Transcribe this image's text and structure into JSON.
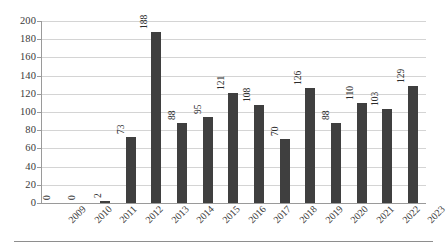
{
  "chart_data": {
    "type": "bar",
    "title": "",
    "subtitle": "",
    "xlabel": "",
    "ylabel": "",
    "categories": [
      "2009",
      "2010",
      "2011",
      "2012",
      "2013",
      "2014",
      "2015",
      "2016",
      "2017",
      "2018",
      "2019",
      "2020",
      "2021",
      "2022",
      "2023"
    ],
    "values": [
      0,
      0,
      2,
      73,
      188,
      88,
      95,
      121,
      108,
      70,
      126,
      88,
      110,
      103,
      129
    ],
    "data_labels": [
      "0",
      "0",
      "2",
      "73",
      "188",
      "88",
      "95",
      "121",
      "108",
      "70",
      "126",
      "88",
      "110",
      "103",
      "129"
    ],
    "ylim": [
      0,
      200
    ],
    "y_ticks": [
      0,
      20,
      40,
      60,
      80,
      100,
      120,
      140,
      160,
      180,
      200
    ],
    "y_tick_labels": [
      "0",
      "20",
      "40",
      "60",
      "80",
      "100",
      "120",
      "140",
      "160",
      "180",
      "200"
    ],
    "grid": true,
    "grid_axis": "y",
    "legend": false,
    "legend_position": "none",
    "series": [
      {
        "name": "",
        "values": [
          0,
          0,
          2,
          73,
          188,
          88,
          95,
          121,
          108,
          70,
          126,
          88,
          110,
          103,
          129
        ]
      }
    ]
  },
  "style": {
    "bar_color": "#3f3f3f",
    "grid_color": "#d4d4d4",
    "axis_color": "#9a9a9a",
    "background": "#ffffff",
    "text_color": "#3a3a3a",
    "rule_color": "#8e8e8e"
  }
}
